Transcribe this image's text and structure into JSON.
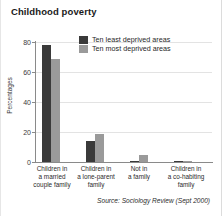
{
  "chart_data": {
    "type": "bar",
    "title": "Childhood poverty",
    "xlabel": "",
    "ylabel": "Percentages",
    "ylim": [
      0,
      80
    ],
    "yticks": [
      0,
      20,
      40,
      60,
      80
    ],
    "grid": true,
    "legend_position": "top-center",
    "categories": [
      "Children in a married couple family",
      "Children in a lone-parent family",
      "Not in a family",
      "Children in a co-habiting family"
    ],
    "category_lines": [
      [
        "Children in",
        "a married",
        "couple family"
      ],
      [
        "Children in",
        "a lone-parent",
        "family"
      ],
      [
        "Not in",
        "a family",
        ""
      ],
      [
        "Children in",
        "a co-habiting",
        "family"
      ]
    ],
    "series": [
      {
        "name": "Ten least deprived areas",
        "color": "#3a3a3a",
        "values": [
          78,
          14,
          1,
          0.6
        ]
      },
      {
        "name": "Ten most deprived areas",
        "color": "#9a9a9a",
        "values": [
          69,
          19,
          5,
          1
        ]
      }
    ],
    "source": "Source: Sociology Review (Sept 2000)"
  }
}
